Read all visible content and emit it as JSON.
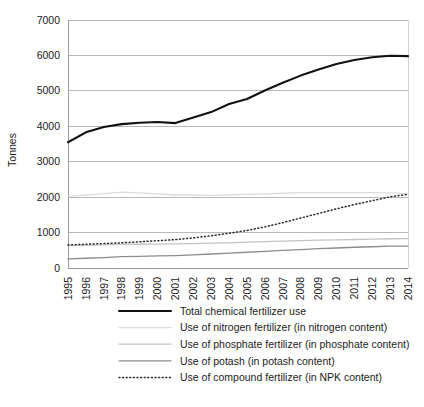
{
  "chart_data": {
    "type": "line",
    "title": "",
    "xlabel": "",
    "ylabel": "Tonnes",
    "ylim": [
      0,
      7000
    ],
    "ytick_labels": [
      "0",
      "1000",
      "2000",
      "3000",
      "4000",
      "5000",
      "6000",
      "7000"
    ],
    "yticks": [
      0,
      1000,
      2000,
      3000,
      4000,
      5000,
      6000,
      7000
    ],
    "grid": true,
    "legend_position": "bottom",
    "categories": [
      "1995",
      "1996",
      "1997",
      "1998",
      "1999",
      "2000",
      "2001",
      "2002",
      "2003",
      "2004",
      "2005",
      "2006",
      "2007",
      "2008",
      "2009",
      "2010",
      "2011",
      "2012",
      "2013",
      "2014"
    ],
    "series": [
      {
        "name": "Total chemical fertilizer use",
        "color": "#111111",
        "width": 2.1,
        "dash": "none",
        "values": [
          3550,
          3830,
          3980,
          4060,
          4100,
          4120,
          4090,
          4250,
          4400,
          4630,
          4770,
          5010,
          5230,
          5430,
          5600,
          5760,
          5870,
          5950,
          5990,
          5980
        ]
      },
      {
        "name": "Use of nitrogen fertilizer (in nitrogen content)",
        "color": "#dcdcdc",
        "width": 1.3,
        "dash": "none",
        "values": [
          2020,
          2060,
          2100,
          2140,
          2120,
          2090,
          2060,
          2060,
          2050,
          2060,
          2080,
          2090,
          2110,
          2130,
          2130,
          2130,
          2130,
          2130,
          2120,
          2100
        ]
      },
      {
        "name": "Use of phosphate fertilizer (in phosphate content)",
        "color": "#c4c4c4",
        "width": 1.3,
        "dash": "none",
        "values": [
          630,
          640,
          650,
          665,
          670,
          675,
          680,
          690,
          700,
          710,
          730,
          745,
          760,
          775,
          785,
          795,
          805,
          815,
          825,
          830
        ]
      },
      {
        "name": "Use of potash (in potash content)",
        "color": "#8c8c8c",
        "width": 1.3,
        "dash": "none",
        "values": [
          255,
          275,
          295,
          320,
          330,
          340,
          350,
          370,
          395,
          420,
          445,
          470,
          495,
          520,
          545,
          565,
          585,
          600,
          615,
          620
        ]
      },
      {
        "name": "Use of compound fertilizer (in NPK content)",
        "color": "#2a2a2a",
        "width": 1.5,
        "dash": "1,2.6",
        "values": [
          650,
          670,
          690,
          710,
          740,
          770,
          800,
          850,
          910,
          980,
          1060,
          1160,
          1280,
          1410,
          1540,
          1670,
          1790,
          1900,
          2010,
          2080
        ]
      }
    ]
  },
  "legend": {
    "items": [
      {
        "label": "Total chemical fertilizer use",
        "color": "#111111",
        "dash": "none",
        "width": 2.1
      },
      {
        "label": "Use of nitrogen fertilizer (in nitrogen content)",
        "color": "#dcdcdc",
        "dash": "none",
        "width": 1.3
      },
      {
        "label": "Use of phosphate fertilizer (in phosphate content)",
        "color": "#c4c4c4",
        "dash": "none",
        "width": 1.3
      },
      {
        "label": "Use of potash (in potash content)",
        "color": "#8c8c8c",
        "dash": "none",
        "width": 1.3
      },
      {
        "label": "Use of compound fertilizer (in NPK content)",
        "color": "#2a2a2a",
        "dash": "1,2.6",
        "width": 1.5
      }
    ]
  },
  "layout": {
    "plot_left": 68,
    "plot_right": 408,
    "plot_top": 20,
    "plot_bottom": 268,
    "legend_x_swatch_start": 119,
    "legend_x_swatch_end": 171,
    "legend_x_text": 180,
    "legend_y_start": 311,
    "legend_row_height": 16.6,
    "ylabel_x": 16,
    "ylabel_y": 150
  }
}
